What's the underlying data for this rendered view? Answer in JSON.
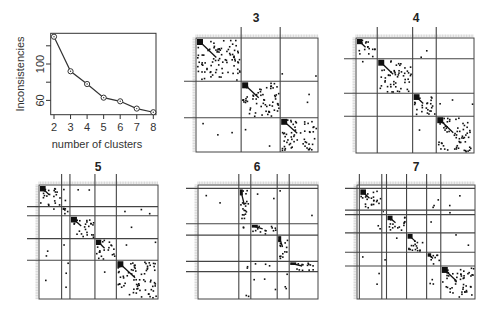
{
  "chart_data": [
    {
      "type": "line",
      "title": "",
      "xlabel": "number of clusters",
      "ylabel": "Inconsistencies",
      "x": [
        2,
        3,
        4,
        5,
        6,
        7,
        8
      ],
      "series": [
        {
          "name": "Inconsistencies",
          "values": [
            130,
            92,
            78,
            63,
            59,
            51,
            47
          ],
          "marker": "circle-dot"
        }
      ],
      "xticks": [
        "2",
        "3",
        "4",
        "5",
        "6",
        "7",
        "8"
      ],
      "yticks": [
        60,
        80,
        100,
        120
      ],
      "ytick_labels": [
        "60",
        "",
        "100",
        ""
      ],
      "ylim": [
        43,
        133
      ],
      "grid": false,
      "legend": false
    },
    {
      "type": "heatmap",
      "title": "3",
      "description": "Reordered binary adjacency matrix partitioned into 3 clusters",
      "n_clusters": 3,
      "col_dividers_frac": [
        0.37,
        0.69
      ],
      "row_dividers_frac": [
        0.38,
        0.7
      ]
    },
    {
      "type": "heatmap",
      "title": "4",
      "description": "Reordered binary adjacency matrix partitioned into 4 clusters",
      "n_clusters": 4,
      "col_dividers_frac": [
        0.18,
        0.48,
        0.68
      ],
      "row_dividers_frac": [
        0.18,
        0.48,
        0.68
      ]
    },
    {
      "type": "heatmap",
      "title": "5",
      "description": "Reordered binary adjacency matrix partitioned into 5 clusters",
      "n_clusters": 5,
      "col_dividers_frac": [
        0.19,
        0.26,
        0.47,
        0.65
      ],
      "row_dividers_frac": [
        0.19,
        0.27,
        0.47,
        0.66
      ]
    },
    {
      "type": "heatmap",
      "title": "6",
      "description": "Reordered binary adjacency matrix partitioned into 6 clusters",
      "n_clusters": 6,
      "col_dividers_frac": [
        0.34,
        0.44,
        0.66,
        0.76
      ],
      "row_dividers_frac": [
        0.03,
        0.34,
        0.44,
        0.67,
        0.76
      ]
    },
    {
      "type": "heatmap",
      "title": "7",
      "description": "Reordered binary adjacency matrix partitioned into 7 clusters",
      "n_clusters": 7,
      "col_dividers_frac": [
        0.02,
        0.21,
        0.25,
        0.42,
        0.59,
        0.71
      ],
      "row_dividers_frac": [
        0.03,
        0.22,
        0.26,
        0.42,
        0.59,
        0.71
      ]
    }
  ],
  "labels": {
    "line_xlabel": "number of clusters",
    "line_ylabel": "Inconsistencies",
    "panel_titles": [
      "3",
      "4",
      "5",
      "6",
      "7"
    ]
  }
}
